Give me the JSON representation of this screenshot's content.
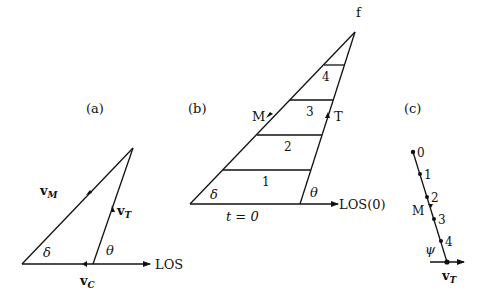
{
  "panels": {
    "a": {
      "label": "(a)",
      "vM": "v",
      "vM_sub": "M",
      "vT": "v",
      "vT_sub": "T",
      "vC": "v",
      "vC_sub": "C",
      "delta": "δ",
      "theta": "θ",
      "los": "LOS"
    },
    "b": {
      "label": "(b)",
      "apex": "f",
      "missile": "M",
      "target": "T",
      "delta": "δ",
      "theta": "θ",
      "los": "LOS(0)",
      "time_zero": "t = 0",
      "segments": [
        "1",
        "2",
        "3",
        "4"
      ]
    },
    "c": {
      "label": "(c)",
      "points": [
        "0",
        "1",
        "2",
        "3",
        "4"
      ],
      "missile": "M",
      "psi": "ψ",
      "vT": "v",
      "vT_sub": "T"
    }
  },
  "colors": {
    "ink": "#111111",
    "background": "#ffffff"
  }
}
